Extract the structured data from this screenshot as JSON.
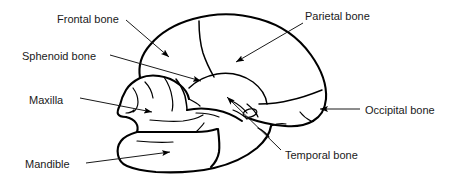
{
  "diagram": {
    "background_color": "#ffffff",
    "line_color": "#000000",
    "text_color": "#1a1a1a",
    "width": 462,
    "height": 182,
    "labels": [
      {
        "id": "frontal-bone",
        "text": "Frontal bone",
        "x": 57,
        "y": 14,
        "leader": "from label down-right to arrowhead on forehead",
        "arrow_target": "frontal squama"
      },
      {
        "id": "sphenoid-bone",
        "text": "Sphenoid bone",
        "x": 22,
        "y": 51,
        "leader": "from label right and slightly down to arrowhead behind orbit",
        "arrow_target": "greater wing of sphenoid"
      },
      {
        "id": "maxilla",
        "text": "Maxilla",
        "x": 29,
        "y": 95,
        "leader": "from label right to arrowhead on upper jaw",
        "arrow_target": "maxillary body"
      },
      {
        "id": "mandible",
        "text": "Mandible",
        "x": 25,
        "y": 159,
        "leader": "from label right and slightly up to arrowhead on lower jaw",
        "arrow_target": "body of mandible"
      },
      {
        "id": "parietal-bone",
        "text": "Parietal bone",
        "x": 305,
        "y": 11,
        "leader": "from label down-left to arrowhead on cranial vault",
        "arrow_target": "parietal eminence"
      },
      {
        "id": "occipital-bone",
        "text": "Occipital bone",
        "x": 365,
        "y": 105,
        "leader": "horizontal line left to arrowhead at rear of skull",
        "arrow_target": "occipital squama"
      },
      {
        "id": "temporal-bone",
        "text": "Temporal bone",
        "x": 285,
        "y": 150,
        "leader": "from label up-left to arrowhead on temporal squama",
        "arrow_target": "squamous part of temporal bone"
      }
    ]
  }
}
